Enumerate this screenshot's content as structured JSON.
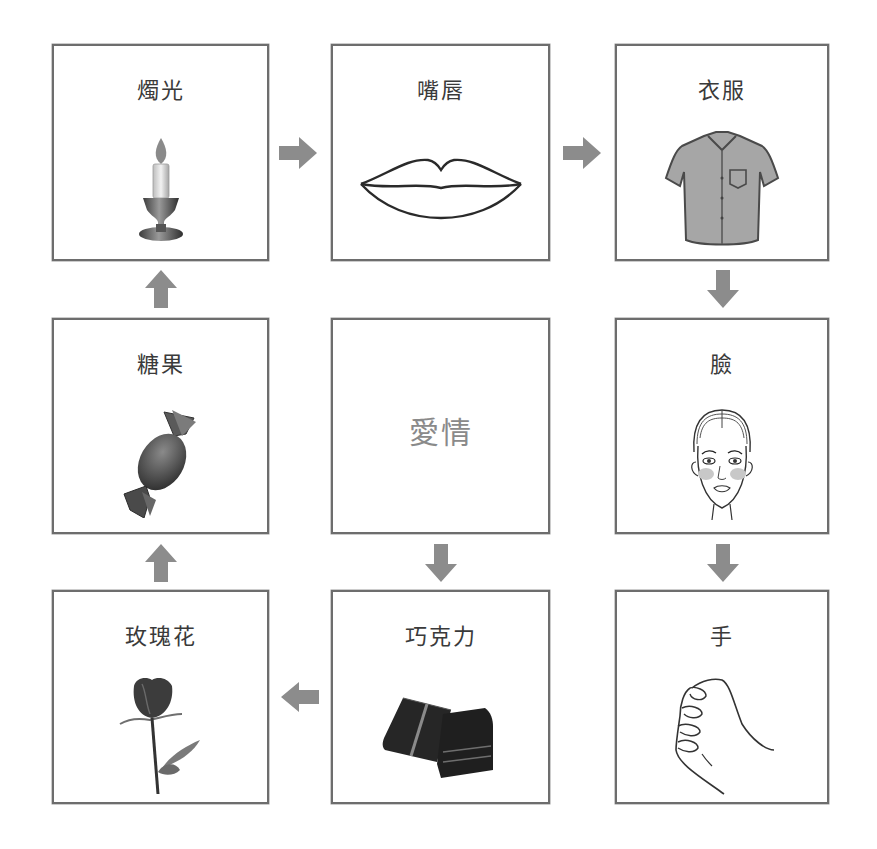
{
  "diagram": {
    "center": {
      "label": "愛情"
    },
    "cells": [
      {
        "id": "candle",
        "label": "燭光",
        "icon": "candle-icon"
      },
      {
        "id": "lips",
        "label": "嘴唇",
        "icon": "lips-icon"
      },
      {
        "id": "clothes",
        "label": "衣服",
        "icon": "shirt-icon"
      },
      {
        "id": "face",
        "label": "臉",
        "icon": "face-icon"
      },
      {
        "id": "hand",
        "label": "手",
        "icon": "hand-icon"
      },
      {
        "id": "chocolate",
        "label": "巧克力",
        "icon": "chocolate-icon"
      },
      {
        "id": "rose",
        "label": "玫瑰花",
        "icon": "rose-icon"
      },
      {
        "id": "candy",
        "label": "糖果",
        "icon": "candy-icon"
      }
    ],
    "flow": [
      "燭光 → 嘴唇",
      "嘴唇 → 衣服",
      "衣服 → 臉",
      "臉 → 手",
      "愛情 → 巧克力",
      "巧克力 → 玫瑰花",
      "玫瑰花 → 糖果",
      "糖果 → 燭光"
    ],
    "colors": {
      "border": "#6d6d6d",
      "arrow": "#8c8c8c",
      "center_text": "#8a8a8a",
      "label_text": "#3a3a3a"
    }
  }
}
